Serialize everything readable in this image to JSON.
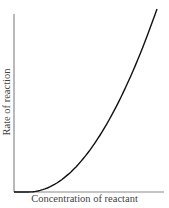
{
  "chart_data": {
    "type": "line",
    "title": "",
    "xlabel": "Concentration of reactant",
    "ylabel": "Rate of reaction",
    "x_ticks": [],
    "y_ticks": [],
    "grid": false,
    "legend": null,
    "xlim": [
      0,
      1
    ],
    "ylim": [
      0,
      1
    ],
    "series": [
      {
        "name": "rate",
        "description": "Rate increases with the square of concentration (second-order, parabolic curve)",
        "x": [
          0.0,
          0.1,
          0.2,
          0.3,
          0.4,
          0.5,
          0.6,
          0.7,
          0.8,
          0.9,
          1.0
        ],
        "y": [
          0.0,
          0.0,
          0.02,
          0.07,
          0.14,
          0.24,
          0.36,
          0.49,
          0.64,
          0.81,
          1.0
        ],
        "color": "#111111"
      }
    ]
  },
  "colors": {
    "axis": "#8a8a8a",
    "curve": "#111111",
    "text": "#444444"
  }
}
